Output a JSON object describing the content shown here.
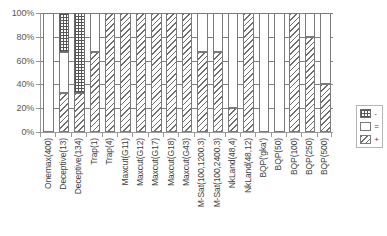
{
  "chart_data": {
    "type": "bar",
    "stacked": true,
    "stacked_mode": "percent",
    "title": "",
    "xlabel": "",
    "ylabel": "",
    "ylim": [
      0,
      100
    ],
    "ytick_labels": [
      "0%",
      "20%",
      "40%",
      "60%",
      "80%",
      "100%"
    ],
    "ytick_values": [
      0,
      20,
      40,
      60,
      80,
      100
    ],
    "grid": true,
    "legend_position": "right",
    "legend": [
      "-",
      "=",
      "+"
    ],
    "categories": [
      "Onemax(400)",
      "Deceptive(13)",
      "Deceptive(134)",
      "Trap(1)",
      "Trap(4)",
      "Maxcut(G11)",
      "Maxcut(G12)",
      "Maxcut(G17)",
      "Maxcut(G18)",
      "Maxcut(G43)",
      "M-Sat(100,1200.3)",
      "M-Sat(100,2400.3)",
      "NkLand(48,4)",
      "NkLand(48,12)",
      "BQP('gka')",
      "BQP(50)",
      "BQP(100)",
      "BQP(250)",
      "BQP(500)"
    ],
    "series": [
      {
        "name": "+",
        "pattern": "diagonal-hatch",
        "values": [
          0,
          33,
          33,
          67,
          100,
          100,
          100,
          100,
          100,
          100,
          67,
          67,
          20,
          100,
          0,
          0,
          100,
          80,
          40
        ]
      },
      {
        "name": "=",
        "pattern": "empty",
        "values": [
          100,
          34,
          0,
          33,
          0,
          0,
          0,
          0,
          0,
          0,
          33,
          33,
          80,
          0,
          100,
          100,
          0,
          20,
          60
        ]
      },
      {
        "name": "-",
        "pattern": "checkered",
        "values": [
          0,
          33,
          67,
          0,
          0,
          0,
          0,
          0,
          0,
          0,
          0,
          0,
          0,
          0,
          0,
          0,
          0,
          0,
          0
        ]
      }
    ]
  }
}
